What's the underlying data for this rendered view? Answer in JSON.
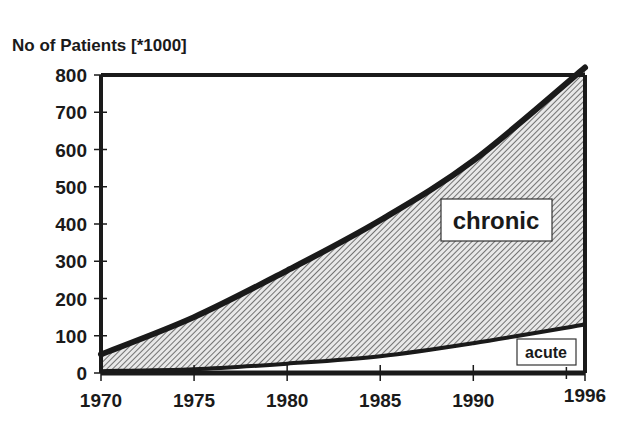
{
  "chart_data": {
    "type": "area",
    "title": "",
    "ylabel": "No of Patients [*1000]",
    "xlabel": "",
    "ylim": [
      0,
      800
    ],
    "xlim": [
      1970,
      1996
    ],
    "yticks": [
      "0",
      "100",
      "200",
      "300",
      "400",
      "500",
      "600",
      "700",
      "800"
    ],
    "xticks": [
      "1970",
      "1975",
      "1980",
      "1985",
      "1990",
      "1996"
    ],
    "grid": false,
    "legend_position": "inline labels",
    "x": [
      1970,
      1975,
      1980,
      1985,
      1990,
      1996
    ],
    "series": [
      {
        "name": "chronic",
        "values": [
          50,
          150,
          275,
          410,
          570,
          820
        ],
        "fill": "hatched"
      },
      {
        "name": "acute",
        "values": [
          5,
          10,
          25,
          45,
          80,
          130
        ],
        "fill": "white"
      }
    ],
    "annotations": [
      "chronic",
      "acute"
    ]
  }
}
